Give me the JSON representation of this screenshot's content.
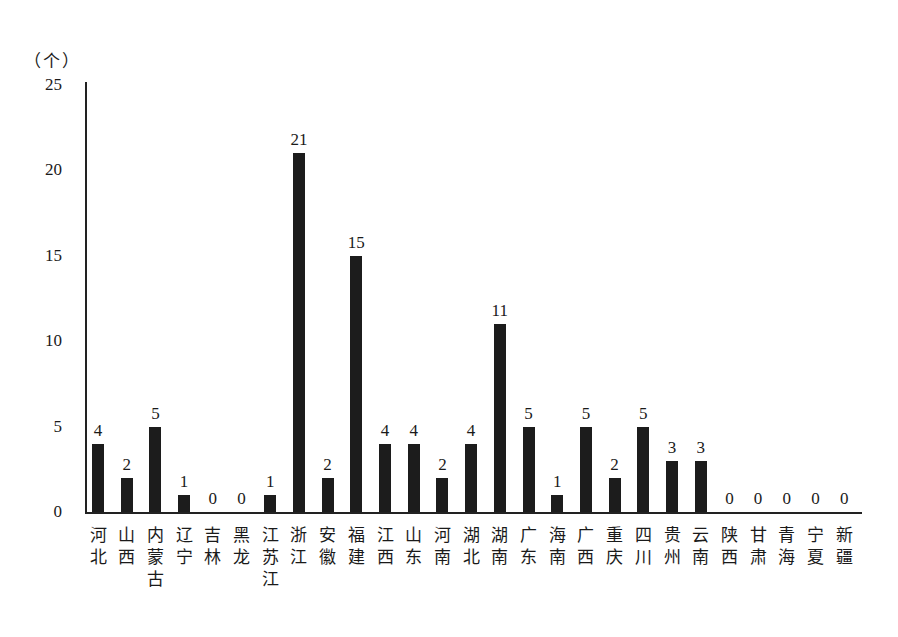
{
  "chart_data": {
    "type": "bar",
    "title": "",
    "xlabel": "",
    "ylabel": "（个）",
    "ylim": [
      0,
      25
    ],
    "yticks": [
      0,
      5,
      10,
      15,
      20,
      25
    ],
    "grid": false,
    "legend": null,
    "categories": [
      "河北",
      "山西",
      "内蒙古",
      "辽宁",
      "吉林",
      "黑龙",
      "江苏江",
      "浙江",
      "安徽",
      "福建",
      "江西",
      "山东",
      "河南",
      "湖北",
      "湖南",
      "广东",
      "海南",
      "广西",
      "重庆",
      "四川",
      "贵州",
      "云南",
      "陕西",
      "甘肃",
      "青海",
      "宁夏",
      "新疆"
    ],
    "values": [
      4,
      2,
      5,
      1,
      0,
      0,
      1,
      21,
      2,
      15,
      4,
      4,
      2,
      4,
      11,
      5,
      1,
      5,
      2,
      5,
      3,
      3,
      0,
      0,
      0,
      0,
      0
    ],
    "data_labels": true,
    "bar_color": "#1c1c1c"
  }
}
